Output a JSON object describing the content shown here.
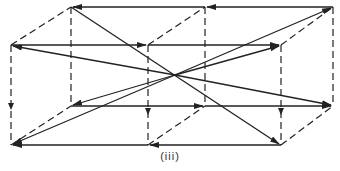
{
  "figure": {
    "caption": "(iii)",
    "colors": {
      "line": "#222222",
      "background": "#ffffff"
    },
    "vertices": {
      "back_top_left": [
        71,
        7
      ],
      "back_top_mid": [
        205,
        7
      ],
      "back_top_right": [
        333,
        7
      ],
      "front_top_left": [
        11,
        45
      ],
      "front_top_mid": [
        148,
        45
      ],
      "front_top_right": [
        281,
        45
      ],
      "back_bottom_left": [
        71,
        106
      ],
      "back_bottom_mid": [
        205,
        106
      ],
      "back_bottom_right": [
        333,
        106
      ],
      "front_bottom_left": [
        11,
        145
      ],
      "front_bottom_mid": [
        148,
        145
      ],
      "front_bottom_right": [
        281,
        145
      ],
      "center": [
        175,
        75
      ]
    }
  }
}
